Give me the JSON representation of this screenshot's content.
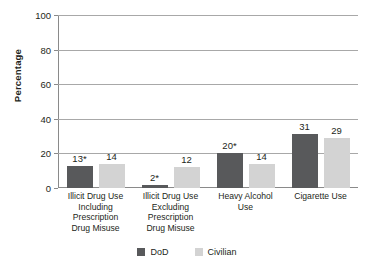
{
  "chart_data": {
    "type": "bar",
    "title": "",
    "xlabel": "",
    "ylabel": "Percentage",
    "ylim": [
      0,
      100
    ],
    "yticks": [
      0,
      20,
      40,
      60,
      80,
      100
    ],
    "ytick_labels": [
      "0",
      "20",
      "40",
      "60",
      "80",
      "100"
    ],
    "grid": "horizontal",
    "legend_position": "bottom-center",
    "categories": [
      "Illicit Drug Use Including Prescription Drug Misuse",
      "Illicit Drug Use Excluding Prescription Drug Misuse",
      "Heavy Alcohol Use",
      "Cigarette Use"
    ],
    "category_lines": [
      [
        "Illicit Drug Use",
        "Including",
        "Prescription",
        "Drug Misuse"
      ],
      [
        "Illicit Drug Use",
        "Excluding",
        "Prescription",
        "Drug Misuse"
      ],
      [
        "Heavy Alcohol",
        "Use"
      ],
      [
        "Cigarette Use"
      ]
    ],
    "series": [
      {
        "name": "DoD",
        "color": "#58595b",
        "values": [
          13,
          2,
          20,
          31
        ],
        "data_labels": [
          "13*",
          "2*",
          "20*",
          "31"
        ]
      },
      {
        "name": "Civilian",
        "color": "#d3d3d3",
        "values": [
          14,
          12,
          14,
          29
        ],
        "data_labels": [
          "14",
          "12",
          "14",
          "29"
        ]
      }
    ],
    "annotations": [
      "* denotes statistically significant difference"
    ]
  },
  "legend": {
    "items": [
      {
        "label": "DoD",
        "color": "#58595b"
      },
      {
        "label": "Civilian",
        "color": "#d3d3d3"
      }
    ]
  },
  "colors": {
    "dod": "#58595b",
    "civilian": "#d3d3d3",
    "gridline": "#a8a8a8",
    "axis": "#8a8a8a",
    "text": "#231f20",
    "background": "#ffffff"
  }
}
